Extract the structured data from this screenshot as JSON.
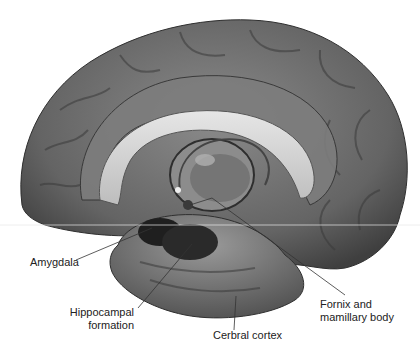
{
  "figure": {
    "style": "grayscale anatomical illustration",
    "labels": [
      {
        "id": "amygdala",
        "text": "Amygdala"
      },
      {
        "id": "hippocampal",
        "line1": "Hippocampal",
        "line2": "formation"
      },
      {
        "id": "cortex",
        "text": "Cerbral cortex"
      },
      {
        "id": "fornix",
        "line1": "Fornix and",
        "line2": "mamillary body"
      }
    ]
  },
  "colors": {
    "background": "#ffffff",
    "cortex_fill": "#6f6f6f",
    "cortex_dark": "#3d3d3d",
    "callosum_fill": "#d6d6d6",
    "leader_line": "#333333",
    "text": "#222222"
  }
}
